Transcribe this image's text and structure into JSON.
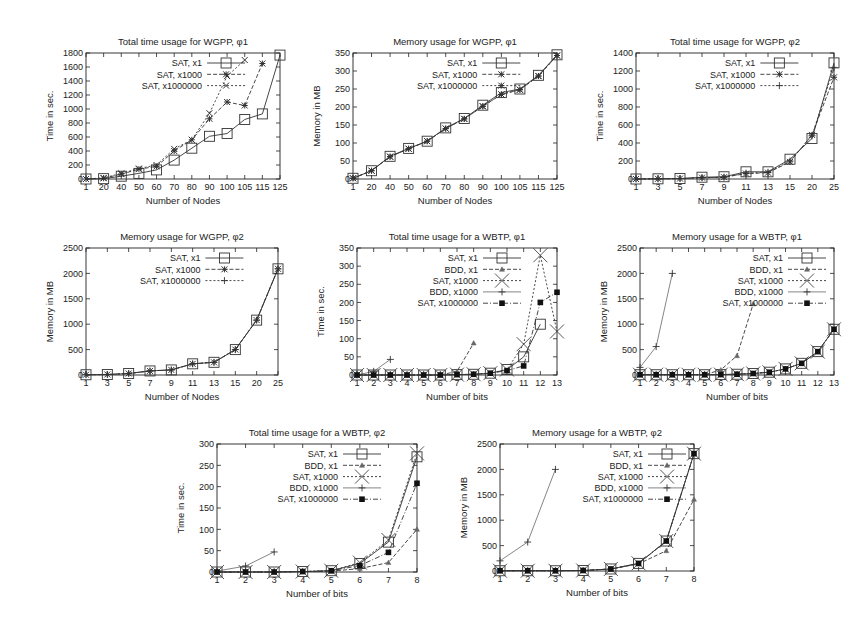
{
  "chart_data": [
    {
      "id": "time-wgpp-phi1",
      "type": "line",
      "title": "Total time usage for WGPP, φ1",
      "xlabel": "Number of Nodes",
      "ylabel": "Time in sec.",
      "categories": [
        "1",
        "20",
        "40",
        "50",
        "60",
        "70",
        "80",
        "90",
        "100",
        "105",
        "115",
        "125"
      ],
      "ylim": [
        0,
        1800
      ],
      "yticks": [
        0,
        200,
        400,
        600,
        800,
        1000,
        1200,
        1400,
        1600,
        1800
      ],
      "legend_position": "top-left",
      "series": [
        {
          "name": "SAT, x1",
          "marker": "square",
          "dash": "solid",
          "values": [
            0,
            5,
            40,
            80,
            130,
            270,
            440,
            610,
            650,
            850,
            930,
            1770
          ]
        },
        {
          "name": "SAT, x1000",
          "marker": "star",
          "dash": "dashed",
          "values": [
            0,
            10,
            70,
            140,
            180,
            400,
            560,
            860,
            1100,
            1050,
            1650,
            null
          ]
        },
        {
          "name": "SAT, x1000000",
          "marker": "x",
          "dash": "dotted",
          "values": [
            0,
            15,
            80,
            150,
            200,
            430,
            560,
            940,
            1470,
            1700,
            null,
            null
          ]
        }
      ]
    },
    {
      "id": "memory-wgpp-phi1",
      "type": "line",
      "title": "Memory usage for WGPP, φ1",
      "xlabel": "Number of Nodes",
      "ylabel": "Memory in MB",
      "categories": [
        "1",
        "20",
        "40",
        "50",
        "60",
        "70",
        "80",
        "90",
        "100",
        "105",
        "115",
        "125"
      ],
      "ylim": [
        0,
        350
      ],
      "yticks": [
        0,
        50,
        100,
        150,
        200,
        250,
        300,
        350
      ],
      "legend_position": "top-left",
      "series": [
        {
          "name": "SAT, x1",
          "marker": "square",
          "dash": "solid",
          "values": [
            2,
            23,
            63,
            85,
            105,
            142,
            168,
            205,
            240,
            250,
            288,
            345
          ]
        },
        {
          "name": "SAT, x1000",
          "marker": "star",
          "dash": "dashed",
          "values": [
            2,
            23,
            62,
            84,
            105,
            140,
            167,
            202,
            235,
            248,
            286,
            343
          ]
        },
        {
          "name": "SAT, x1000000",
          "marker": "star",
          "dash": "dotted",
          "values": [
            2,
            23,
            62,
            84,
            105,
            140,
            167,
            202,
            235,
            248,
            286,
            343
          ]
        }
      ]
    },
    {
      "id": "time-wgpp-phi2",
      "type": "line",
      "title": "Total time usage for WGPP, φ2",
      "xlabel": "Number of Nodes",
      "ylabel": "Time in sec.",
      "categories": [
        "1",
        "3",
        "5",
        "7",
        "9",
        "11",
        "13",
        "15",
        "20",
        "25"
      ],
      "ylim": [
        0,
        1400
      ],
      "yticks": [
        0,
        200,
        400,
        600,
        800,
        1000,
        1200,
        1400
      ],
      "legend_position": "top-left",
      "series": [
        {
          "name": "SAT, x1",
          "marker": "square",
          "dash": "solid",
          "values": [
            0,
            2,
            5,
            20,
            25,
            80,
            80,
            220,
            450,
            1290
          ]
        },
        {
          "name": "SAT, x1000",
          "marker": "star",
          "dash": "dashed",
          "values": [
            0,
            2,
            5,
            15,
            20,
            60,
            70,
            190,
            490,
            1130
          ]
        },
        {
          "name": "SAT, x1000000",
          "marker": "plus",
          "dash": "dotted",
          "values": [
            0,
            2,
            5,
            15,
            20,
            65,
            75,
            200,
            480,
            1240
          ]
        }
      ]
    },
    {
      "id": "memory-wgpp-phi2",
      "type": "line",
      "title": "Memory usage for WGPP, φ2",
      "xlabel": "Number of Nodes",
      "ylabel": "Memory in MB",
      "categories": [
        "1",
        "3",
        "5",
        "7",
        "9",
        "11",
        "13",
        "15",
        "20",
        "25"
      ],
      "ylim": [
        0,
        2500
      ],
      "yticks": [
        0,
        500,
        1000,
        1500,
        2000,
        2500
      ],
      "legend_position": "top-left",
      "series": [
        {
          "name": "SAT, x1",
          "marker": "square",
          "dash": "solid",
          "values": [
            5,
            10,
            30,
            80,
            100,
            220,
            250,
            500,
            1080,
            2090
          ]
        },
        {
          "name": "SAT, x1000",
          "marker": "star",
          "dash": "dashed",
          "values": [
            5,
            10,
            30,
            80,
            100,
            220,
            250,
            500,
            1080,
            2090
          ]
        },
        {
          "name": "SAT, x1000000",
          "marker": "plus",
          "dash": "dotted",
          "values": [
            5,
            10,
            30,
            80,
            100,
            220,
            250,
            500,
            1080,
            2090
          ]
        }
      ]
    },
    {
      "id": "time-wbtp-phi1",
      "type": "line",
      "title": "Total time usage for a WBTP, φ1",
      "xlabel": "Number of bits",
      "ylabel": "Time in sec.",
      "categories": [
        "1",
        "2",
        "3",
        "4",
        "5",
        "6",
        "7",
        "8",
        "9",
        "10",
        "11",
        "12",
        "13"
      ],
      "ylim": [
        0,
        350
      ],
      "yticks": [
        0,
        50,
        100,
        150,
        200,
        250,
        300,
        350
      ],
      "legend_position": "top-left",
      "series": [
        {
          "name": "SAT, x1",
          "marker": "square",
          "dash": "solid",
          "values": [
            0,
            0,
            0,
            0,
            0,
            0,
            1,
            2,
            5,
            15,
            50,
            140,
            null
          ]
        },
        {
          "name": "BDD, x1",
          "marker": "triangle",
          "dash": "dashed",
          "values": [
            0,
            0,
            0,
            0,
            0,
            0,
            10,
            88,
            null,
            null,
            null,
            null,
            null
          ]
        },
        {
          "name": "SAT, x1000",
          "marker": "bigx",
          "dash": "dotted",
          "values": [
            0,
            0,
            0,
            0,
            0,
            0,
            1,
            2,
            5,
            15,
            85,
            330,
            120
          ]
        },
        {
          "name": "BDD, x1000",
          "marker": "plus",
          "dash": "solid-thin",
          "values": [
            0,
            10,
            43,
            null,
            null,
            null,
            null,
            null,
            null,
            null,
            null,
            null,
            null
          ]
        },
        {
          "name": "SAT, x1000000",
          "marker": "filledsquare",
          "dash": "dashdot",
          "values": [
            0,
            0,
            0,
            0,
            0,
            0,
            1,
            2,
            5,
            12,
            25,
            200,
            228
          ]
        }
      ]
    },
    {
      "id": "memory-wbtp-phi1",
      "type": "line",
      "title": "Memory usage for a WBTP, φ1",
      "xlabel": "Number of bits",
      "ylabel": "Memory in MB",
      "categories": [
        "1",
        "2",
        "3",
        "4",
        "5",
        "6",
        "7",
        "8",
        "9",
        "10",
        "11",
        "12",
        "13"
      ],
      "ylim": [
        0,
        2500
      ],
      "yticks": [
        0,
        500,
        1000,
        1500,
        2000,
        2500
      ],
      "legend_position": "top-right",
      "series": [
        {
          "name": "SAT, x1",
          "marker": "square",
          "dash": "solid",
          "values": [
            5,
            5,
            5,
            5,
            5,
            8,
            15,
            30,
            55,
            120,
            230,
            460,
            900
          ]
        },
        {
          "name": "BDD, x1",
          "marker": "triangle",
          "dash": "dashed",
          "values": [
            5,
            5,
            5,
            5,
            5,
            100,
            380,
            1400,
            null,
            null,
            null,
            null,
            null
          ]
        },
        {
          "name": "SAT, x1000",
          "marker": "bigx",
          "dash": "dotted",
          "values": [
            5,
            5,
            5,
            5,
            5,
            8,
            15,
            30,
            55,
            120,
            230,
            460,
            900
          ]
        },
        {
          "name": "BDD, x1000",
          "marker": "plus",
          "dash": "solid-thin",
          "values": [
            150,
            560,
            2000,
            null,
            null,
            null,
            null,
            null,
            null,
            null,
            null,
            null,
            null
          ]
        },
        {
          "name": "SAT, x1000000",
          "marker": "filledsquare",
          "dash": "dashdot",
          "values": [
            5,
            5,
            5,
            5,
            5,
            8,
            15,
            30,
            55,
            120,
            230,
            460,
            900
          ]
        }
      ]
    },
    {
      "id": "time-wbtp-phi2",
      "type": "line",
      "title": "Total time usage for a WBTP, φ2",
      "xlabel": "Number of bits",
      "ylabel": "Time in sec.",
      "categories": [
        "1",
        "2",
        "3",
        "4",
        "5",
        "6",
        "7",
        "8"
      ],
      "ylim": [
        0,
        300
      ],
      "yticks": [
        0,
        50,
        100,
        150,
        200,
        250,
        300
      ],
      "legend_position": "top-left",
      "series": [
        {
          "name": "SAT, x1",
          "marker": "square",
          "dash": "solid",
          "values": [
            0,
            0,
            0,
            1,
            3,
            20,
            70,
            270
          ]
        },
        {
          "name": "BDD, x1",
          "marker": "triangle",
          "dash": "dashed",
          "values": [
            0,
            0,
            0,
            1,
            2,
            8,
            22,
            100
          ]
        },
        {
          "name": "SAT, x1000",
          "marker": "bigx",
          "dash": "dotted",
          "values": [
            0,
            0,
            0,
            1,
            3,
            22,
            75,
            278
          ]
        },
        {
          "name": "BDD, x1000",
          "marker": "plus",
          "dash": "solid-thin",
          "values": [
            2,
            14,
            47,
            null,
            null,
            null,
            null,
            null
          ]
        },
        {
          "name": "SAT, x1000000",
          "marker": "filledsquare",
          "dash": "dashdot",
          "values": [
            0,
            0,
            0,
            1,
            3,
            15,
            46,
            208
          ]
        }
      ]
    },
    {
      "id": "memory-wbtp-phi2",
      "type": "line",
      "title": "Memory usage for a WBTP, φ2",
      "xlabel": "Number of bits",
      "ylabel": "Memory in MB",
      "categories": [
        "1",
        "2",
        "3",
        "4",
        "5",
        "6",
        "7",
        "8"
      ],
      "ylim": [
        0,
        2500
      ],
      "yticks": [
        0,
        500,
        1000,
        1500,
        2000,
        2500
      ],
      "legend_position": "top-right",
      "series": [
        {
          "name": "SAT, x1",
          "marker": "square",
          "dash": "solid",
          "values": [
            5,
            5,
            5,
            10,
            40,
            150,
            590,
            2310
          ]
        },
        {
          "name": "BDD, x1",
          "marker": "triangle",
          "dash": "dashed",
          "values": [
            5,
            5,
            5,
            10,
            40,
            140,
            400,
            1410
          ]
        },
        {
          "name": "SAT, x1000",
          "marker": "bigx",
          "dash": "dotted",
          "values": [
            5,
            5,
            5,
            10,
            40,
            150,
            590,
            2310
          ]
        },
        {
          "name": "BDD, x1000",
          "marker": "plus",
          "dash": "solid-thin",
          "values": [
            200,
            570,
            2000,
            null,
            null,
            null,
            null,
            null
          ]
        },
        {
          "name": "SAT, x1000000",
          "marker": "filledsquare",
          "dash": "dashdot",
          "values": [
            5,
            5,
            5,
            10,
            40,
            150,
            590,
            2310
          ]
        }
      ]
    }
  ]
}
